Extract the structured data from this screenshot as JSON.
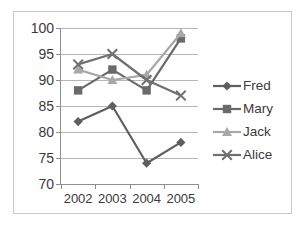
{
  "chart_data": {
    "type": "line",
    "title": "",
    "xlabel": "",
    "ylabel": "",
    "categories": [
      "2002",
      "2003",
      "2004",
      "2005"
    ],
    "ylim": [
      70,
      100
    ],
    "y_ticks": [
      70,
      75,
      80,
      85,
      90,
      95,
      100
    ],
    "grid": true,
    "legend_position": "right",
    "series": [
      {
        "name": "Fred",
        "marker": "diamond",
        "color": "#5f5f5f",
        "values": [
          82,
          85,
          74,
          78
        ]
      },
      {
        "name": "Mary",
        "marker": "square",
        "color": "#6a6a6a",
        "values": [
          88,
          92,
          88,
          98
        ]
      },
      {
        "name": "Jack",
        "marker": "triangle",
        "color": "#a8a8a8",
        "values": [
          92,
          90,
          91,
          99
        ]
      },
      {
        "name": "Alice",
        "marker": "cross-x",
        "color": "#707070",
        "values": [
          93,
          95,
          90,
          87
        ]
      }
    ]
  },
  "axes": {
    "y_tick_labels": [
      "100",
      "95",
      "90",
      "85",
      "80",
      "75",
      "70"
    ],
    "x_tick_labels": [
      "2002",
      "2003",
      "2004",
      "2005"
    ]
  },
  "legend": {
    "items": [
      {
        "label": "Fred"
      },
      {
        "label": "Mary"
      },
      {
        "label": "Jack"
      },
      {
        "label": "Alice"
      }
    ]
  },
  "colors": {
    "frame_border": "#c9c9c9",
    "gridline": "#b7b7b7",
    "axis_line": "#8f8f8f",
    "text": "#3a3a3a",
    "background": "#ffffff"
  }
}
